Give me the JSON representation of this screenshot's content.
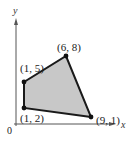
{
  "diagram": {
    "type": "coordinate-plane-polygon",
    "axes": {
      "x_label": "x",
      "y_label": "y",
      "origin_label": "0"
    },
    "vertices": [
      {
        "label": "(1, 2)",
        "x": 1,
        "y": 2
      },
      {
        "label": "(1, 5)",
        "x": 1,
        "y": 5
      },
      {
        "label": "(6, 8)",
        "x": 6,
        "y": 8
      },
      {
        "label": "(9, 1)",
        "x": 9,
        "y": 1
      }
    ],
    "colors": {
      "fill": "#c8c8c8",
      "edge": "#1a1a1a",
      "axis": "#555555"
    }
  }
}
